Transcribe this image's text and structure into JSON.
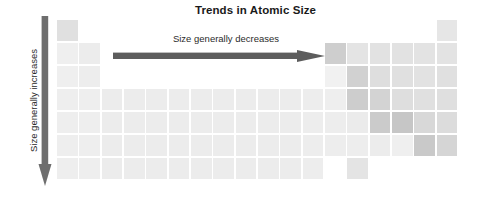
{
  "title": "Trends in Atomic Size",
  "horizontal_trend": {
    "label": "Size generally decreases",
    "direction": "right",
    "arrow_color": "#5d5d5d"
  },
  "vertical_trend": {
    "label": "Size generally increases",
    "direction": "down",
    "arrow_color": "#6e6e6e"
  },
  "chart_data": {
    "type": "heatmap",
    "title": "Trends in Atomic Size",
    "xlabel": "Group (1-18)",
    "ylabel": "Period (1-7)",
    "grid": false,
    "legend": "none",
    "annotations": [
      "Size generally decreases",
      "Size generally increases"
    ],
    "columns": 18,
    "rows": 7,
    "x": [
      1,
      2,
      3,
      4,
      5,
      6,
      7,
      8,
      9,
      10,
      11,
      12,
      13,
      14,
      15,
      16,
      17,
      18
    ],
    "y": [
      1,
      2,
      3,
      4,
      5,
      6,
      7
    ],
    "colors": {
      "lightest": "#f0f0f0",
      "light": "#ebebeb",
      "medium_light": "#e3e3e3",
      "medium": "#d9d9d9",
      "medium_dark": "#cfcfcf",
      "dark": "#c6c6c6",
      "empty": "#ffffff"
    },
    "cells": [
      {
        "row": 1,
        "col": 1,
        "shade": "#e0e0e0"
      },
      {
        "row": 1,
        "col": 18,
        "shade": "#e6e6e6"
      },
      {
        "row": 2,
        "col": 1,
        "shade": "#efefef"
      },
      {
        "row": 2,
        "col": 2,
        "shade": "#ececec"
      },
      {
        "row": 2,
        "col": 13,
        "shade": "#cecece"
      },
      {
        "row": 2,
        "col": 14,
        "shade": "#e4e4e4"
      },
      {
        "row": 2,
        "col": 15,
        "shade": "#e2e2e2"
      },
      {
        "row": 2,
        "col": 16,
        "shade": "#e2e2e2"
      },
      {
        "row": 2,
        "col": 17,
        "shade": "#e3e3e3"
      },
      {
        "row": 2,
        "col": 18,
        "shade": "#e3e3e3"
      },
      {
        "row": 3,
        "col": 1,
        "shade": "#efefef"
      },
      {
        "row": 3,
        "col": 2,
        "shade": "#ededed"
      },
      {
        "row": 3,
        "col": 13,
        "shade": "#f1f1f1"
      },
      {
        "row": 3,
        "col": 14,
        "shade": "#d1d1d1"
      },
      {
        "row": 3,
        "col": 15,
        "shade": "#dedede"
      },
      {
        "row": 3,
        "col": 16,
        "shade": "#e0e0e0"
      },
      {
        "row": 3,
        "col": 17,
        "shade": "#e2e2e2"
      },
      {
        "row": 3,
        "col": 18,
        "shade": "#e0e0e0"
      },
      {
        "row": 4,
        "col": 1,
        "shade": "#eeeeee"
      },
      {
        "row": 4,
        "col": 2,
        "shade": "#eeeeee"
      },
      {
        "row": 4,
        "col": 3,
        "shade": "#ececec"
      },
      {
        "row": 4,
        "col": 4,
        "shade": "#ececec"
      },
      {
        "row": 4,
        "col": 5,
        "shade": "#ececec"
      },
      {
        "row": 4,
        "col": 6,
        "shade": "#ececec"
      },
      {
        "row": 4,
        "col": 7,
        "shade": "#ececec"
      },
      {
        "row": 4,
        "col": 8,
        "shade": "#ececec"
      },
      {
        "row": 4,
        "col": 9,
        "shade": "#ececec"
      },
      {
        "row": 4,
        "col": 10,
        "shade": "#ececec"
      },
      {
        "row": 4,
        "col": 11,
        "shade": "#ececec"
      },
      {
        "row": 4,
        "col": 12,
        "shade": "#ededed"
      },
      {
        "row": 4,
        "col": 13,
        "shade": "#eeeeee"
      },
      {
        "row": 4,
        "col": 14,
        "shade": "#cdcdcd"
      },
      {
        "row": 4,
        "col": 15,
        "shade": "#d3d3d3"
      },
      {
        "row": 4,
        "col": 16,
        "shade": "#dedede"
      },
      {
        "row": 4,
        "col": 17,
        "shade": "#e0e0e0"
      },
      {
        "row": 4,
        "col": 18,
        "shade": "#dfdfdf"
      },
      {
        "row": 5,
        "col": 1,
        "shade": "#eeeeee"
      },
      {
        "row": 5,
        "col": 2,
        "shade": "#eeeeee"
      },
      {
        "row": 5,
        "col": 3,
        "shade": "#ececec"
      },
      {
        "row": 5,
        "col": 4,
        "shade": "#ececec"
      },
      {
        "row": 5,
        "col": 5,
        "shade": "#ececec"
      },
      {
        "row": 5,
        "col": 6,
        "shade": "#ececec"
      },
      {
        "row": 5,
        "col": 7,
        "shade": "#ececec"
      },
      {
        "row": 5,
        "col": 8,
        "shade": "#ececec"
      },
      {
        "row": 5,
        "col": 9,
        "shade": "#ececec"
      },
      {
        "row": 5,
        "col": 10,
        "shade": "#ececec"
      },
      {
        "row": 5,
        "col": 11,
        "shade": "#ececec"
      },
      {
        "row": 5,
        "col": 12,
        "shade": "#ededed"
      },
      {
        "row": 5,
        "col": 13,
        "shade": "#ededed"
      },
      {
        "row": 5,
        "col": 14,
        "shade": "#ebebeb"
      },
      {
        "row": 5,
        "col": 15,
        "shade": "#cbcbcb"
      },
      {
        "row": 5,
        "col": 16,
        "shade": "#c6c6c6"
      },
      {
        "row": 5,
        "col": 17,
        "shade": "#d8d8d8"
      },
      {
        "row": 5,
        "col": 18,
        "shade": "#dcdcdc"
      },
      {
        "row": 6,
        "col": 1,
        "shade": "#eeeeee"
      },
      {
        "row": 6,
        "col": 2,
        "shade": "#eeeeee"
      },
      {
        "row": 6,
        "col": 3,
        "shade": "#ececec"
      },
      {
        "row": 6,
        "col": 4,
        "shade": "#ececec"
      },
      {
        "row": 6,
        "col": 5,
        "shade": "#ececec"
      },
      {
        "row": 6,
        "col": 6,
        "shade": "#ececec"
      },
      {
        "row": 6,
        "col": 7,
        "shade": "#ececec"
      },
      {
        "row": 6,
        "col": 8,
        "shade": "#ececec"
      },
      {
        "row": 6,
        "col": 9,
        "shade": "#ececec"
      },
      {
        "row": 6,
        "col": 10,
        "shade": "#ececec"
      },
      {
        "row": 6,
        "col": 11,
        "shade": "#ececec"
      },
      {
        "row": 6,
        "col": 12,
        "shade": "#ededed"
      },
      {
        "row": 6,
        "col": 13,
        "shade": "#ededed"
      },
      {
        "row": 6,
        "col": 14,
        "shade": "#ededed"
      },
      {
        "row": 6,
        "col": 15,
        "shade": "#ececec"
      },
      {
        "row": 6,
        "col": 16,
        "shade": "#efefef"
      },
      {
        "row": 6,
        "col": 17,
        "shade": "#c9c9c9"
      },
      {
        "row": 6,
        "col": 18,
        "shade": "#d5d5d5"
      },
      {
        "row": 7,
        "col": 1,
        "shade": "#eeeeee"
      },
      {
        "row": 7,
        "col": 2,
        "shade": "#eeeeee"
      },
      {
        "row": 7,
        "col": 3,
        "shade": "#ececec"
      },
      {
        "row": 7,
        "col": 4,
        "shade": "#ececec"
      },
      {
        "row": 7,
        "col": 5,
        "shade": "#ececec"
      },
      {
        "row": 7,
        "col": 6,
        "shade": "#ececec"
      },
      {
        "row": 7,
        "col": 7,
        "shade": "#ececec"
      },
      {
        "row": 7,
        "col": 8,
        "shade": "#ececec"
      },
      {
        "row": 7,
        "col": 9,
        "shade": "#ececec"
      },
      {
        "row": 7,
        "col": 10,
        "shade": "#ececec"
      },
      {
        "row": 7,
        "col": 11,
        "shade": "#ececec"
      },
      {
        "row": 7,
        "col": 12,
        "shade": "#ededed"
      },
      {
        "row": 7,
        "col": 14,
        "shade": "#e4e4e4"
      }
    ]
  }
}
